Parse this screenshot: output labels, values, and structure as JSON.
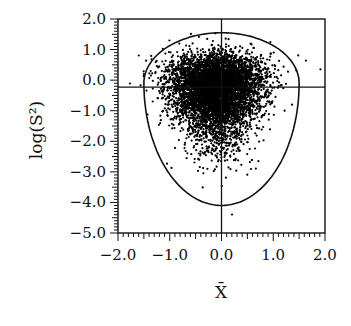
{
  "chart_data": {
    "type": "scatter",
    "title": "",
    "xlabel": "X̄",
    "ylabel": "log(S²)",
    "xlim": [
      -2.0,
      2.0
    ],
    "ylim": [
      -5.0,
      2.0
    ],
    "x_ticks": [
      -2.0,
      -1.0,
      0.0,
      1.0,
      2.0
    ],
    "x_tick_labels": [
      "−2.0",
      "−1.0",
      "0.0",
      "1.0",
      "2.0"
    ],
    "y_ticks": [
      2.0,
      1.0,
      0.0,
      -1.0,
      -2.0,
      -3.0,
      -4.0,
      -5.0
    ],
    "y_tick_labels": [
      "2.0",
      "1.0",
      "0.0",
      "−1.0",
      "−2.0",
      "−3.0",
      "−4.0",
      "−5.0"
    ],
    "minor_tick_step_x": 0.1,
    "minor_tick_step_y": 0.1,
    "grid": false,
    "legend": null,
    "reference_lines": {
      "vertical_x": 0.0,
      "horizontal_y": -0.23
    },
    "contour": {
      "description": "closed egg-shaped boundary curve around the point cloud",
      "center_x": 0.0,
      "top_y": 1.55,
      "widest_y": -0.1,
      "half_width": 1.5,
      "bottom_y": -4.1
    },
    "point_cloud": {
      "description": "dense scatter of simulated (X̄, log S²) pairs",
      "approx_count": 6000,
      "center_x": -0.1,
      "center_y": -0.3,
      "sd_x": 0.45,
      "y_distribution": "left-skewed (long lower tail)",
      "point_color": "#000000"
    },
    "colors": {
      "axis": "#111111",
      "points": "#000000",
      "background": "#ffffff"
    }
  }
}
